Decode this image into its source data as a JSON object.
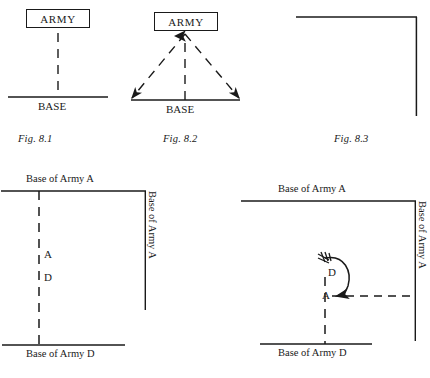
{
  "page": {
    "background_color": "#ffffff",
    "ink_color": "#1a1a1a",
    "width": 430,
    "height": 378
  },
  "figures": [
    {
      "id": "fig-8-1",
      "caption": "Fig. 8.1",
      "box_label": "ARMY",
      "base_label": "BASE",
      "description": "Single dashed line of communication from ARMY down to BASE"
    },
    {
      "id": "fig-8-2",
      "caption": "Fig. 8.2",
      "box_label": "ARMY",
      "base_label": "BASE",
      "description": "Three dashed lines of communication converging on ARMY from a wide BASE"
    },
    {
      "id": "fig-8-3",
      "caption": "Fig. 8.3",
      "description": "Right-angle L shape of two solid base lines"
    }
  ],
  "diagram_left": {
    "id": "diagram-left",
    "label_top": "Base of Army A",
    "label_right": "Base of Army A",
    "label_bottom": "Base of Army D",
    "marker_a": "A",
    "marker_d": "D"
  },
  "diagram_right": {
    "id": "diagram-right",
    "label_top": "Base of Army A",
    "label_right": "Base of Army A",
    "label_bottom": "Base of Army D",
    "marker_a": "A",
    "marker_d": "D"
  }
}
